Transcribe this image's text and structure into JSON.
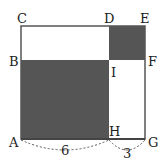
{
  "diagram": {
    "points": {
      "A": "A",
      "B": "B",
      "C": "C",
      "D": "D",
      "E": "E",
      "F": "F",
      "G": "G",
      "H": "H",
      "I": "I"
    },
    "measurements": {
      "AH": "6",
      "HG": "3"
    },
    "colors": {
      "shaded": "#555555",
      "line": "#444444"
    }
  }
}
